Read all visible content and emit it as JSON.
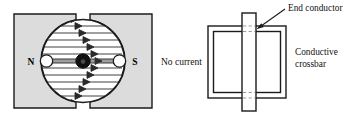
{
  "figure": {
    "width": 351,
    "height": 121,
    "background": "#ffffff",
    "stroke_color": "#1a1a1a",
    "magnet_fill": "#dcdcdc",
    "hub_fill": "#111111",
    "dash_color": "#9a9a9a"
  },
  "left_diagram": {
    "name": "magnet-field-diagram",
    "north_pole_label": "N",
    "south_pole_label": "S",
    "caption": "No current",
    "field_lines": {
      "count": 13,
      "direction": "left-to-right",
      "arrowhead": "right-triangle"
    },
    "gap_circle": {
      "cx": 83,
      "cy": 61,
      "r": 42
    },
    "axle": {
      "left_bearing": true,
      "right_bearing": true,
      "hub": true
    }
  },
  "right_diagram": {
    "name": "conductor-loop-diagram",
    "annotations": [
      {
        "id": "end-conductor",
        "label": "End conductor"
      },
      {
        "id": "conductive-crossbar",
        "line1": "Conductive",
        "line2": "crossbar"
      }
    ],
    "loop": {
      "style": "double-line rectangle",
      "x": 208,
      "y": 26,
      "width": 78,
      "height": 72
    },
    "crossbar": {
      "orientation": "vertical",
      "x": 242,
      "y": 13,
      "width": 14,
      "height": 98
    }
  }
}
